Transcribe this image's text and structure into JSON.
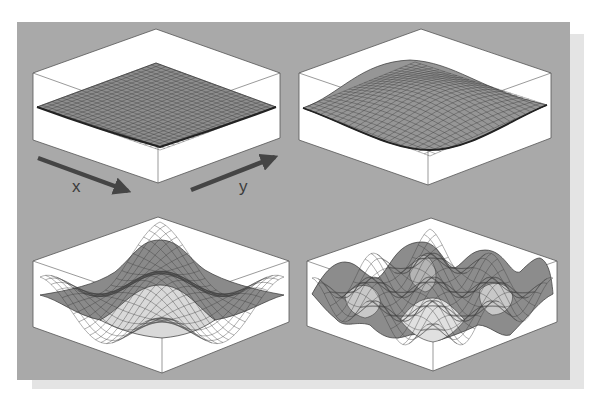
{
  "figure": {
    "background_color": "#a9a9a9",
    "box_color": "#ffffff",
    "surface_color": "#8c8c8c",
    "highlight_color": "#d8d8d8",
    "arrow_color": "#454545"
  },
  "axes": {
    "x_label": "x",
    "y_label": "y"
  },
  "panels": [
    {
      "position": "top-left",
      "shape": "nearly flat sheet (lowest frequency, slight bowl)"
    },
    {
      "position": "top-right",
      "shape": "single broad wave hump"
    },
    {
      "position": "bottom-left",
      "shape": "central peak with surrounding ring, 2D cosine"
    },
    {
      "position": "bottom-right",
      "shape": "multiple peaks, higher-frequency 2D cosine"
    }
  ]
}
